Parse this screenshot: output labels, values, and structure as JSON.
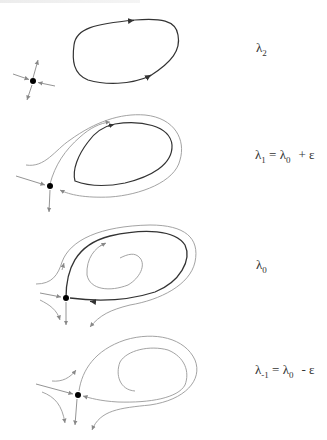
{
  "figure": {
    "type": "bifurcation-diagram",
    "top_text": "",
    "colors": {
      "orbit": "#333333",
      "flow": "#999999",
      "saddle": "#000000",
      "label": "#333333"
    }
  },
  "panels": [
    {
      "id": "lambda2",
      "label": {
        "symbol": "λ",
        "sub": "2",
        "rest": ""
      },
      "saddle": [
        33,
        81
      ],
      "features": [
        "saddle point with 4 separatrices",
        "stable limit cycle"
      ]
    },
    {
      "id": "lambda1",
      "label": {
        "symbol": "λ",
        "sub": "1",
        "eq": "=",
        "symbol2": "λ",
        "sub2": "0",
        "op": "+",
        "eps": "ε"
      },
      "saddle": [
        50,
        186
      ],
      "features": [
        "saddle point",
        "limit cycle",
        "unstable manifold wrapping cycle"
      ]
    },
    {
      "id": "lambda0",
      "label": {
        "symbol": "λ",
        "sub": "0",
        "rest": ""
      },
      "saddle": [
        66,
        298
      ],
      "features": [
        "saddle point",
        "homoclinic orbit",
        "inner spiral"
      ]
    },
    {
      "id": "lambda-1",
      "label": {
        "symbol": "λ",
        "sub": "-1",
        "eq": "=",
        "symbol2": "λ",
        "sub2": "0",
        "op": "-",
        "eps": "ε"
      },
      "saddle": [
        78,
        395
      ],
      "features": [
        "saddle point",
        "broken homoclinic connection",
        "spiral"
      ]
    }
  ]
}
